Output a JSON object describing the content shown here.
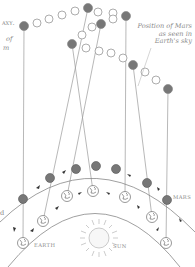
{
  "diagram": {
    "labels": {
      "position_caption": [
        "Position of Mars",
        "as seen in",
        "Earth's sky"
      ],
      "earth": "Earth",
      "mars": "Mars",
      "sun": "Sun",
      "cut_left_top": "axy.",
      "cut_left_mid1": "of",
      "cut_left_mid2": "m",
      "cut_left_low": "d"
    },
    "colors": {
      "line": "#9a9a9a",
      "mars_fill": "#777777",
      "open_circle_stroke": "#9a9a9a",
      "text": "#8a8a8a"
    },
    "sky_positions": [
      {
        "x": 24,
        "y": 26,
        "filled": true
      },
      {
        "x": 37,
        "y": 23,
        "filled": false
      },
      {
        "x": 49,
        "y": 19,
        "filled": false
      },
      {
        "x": 62,
        "y": 15,
        "filled": false
      },
      {
        "x": 75,
        "y": 11,
        "filled": false
      },
      {
        "x": 88,
        "y": 8,
        "filled": true
      },
      {
        "x": 98,
        "y": 12,
        "filled": false
      },
      {
        "x": 101,
        "y": 24,
        "filled": true
      },
      {
        "x": 92,
        "y": 27,
        "filled": false
      },
      {
        "x": 82,
        "y": 35,
        "filled": false
      },
      {
        "x": 72,
        "y": 44,
        "filled": true
      },
      {
        "x": 86,
        "y": 48,
        "filled": false
      },
      {
        "x": 99,
        "y": 51,
        "filled": false
      },
      {
        "x": 113,
        "y": 13,
        "filled": false
      },
      {
        "x": 113,
        "y": 19,
        "filled": false
      },
      {
        "x": 126,
        "y": 16,
        "filled": true
      },
      {
        "x": 111,
        "y": 53,
        "filled": false
      },
      {
        "x": 123,
        "y": 58,
        "filled": false
      },
      {
        "x": 133,
        "y": 65,
        "filled": true
      },
      {
        "x": 145,
        "y": 72,
        "filled": false
      },
      {
        "x": 156,
        "y": 80,
        "filled": false
      },
      {
        "x": 168,
        "y": 89,
        "filled": true
      }
    ],
    "mars_orbit_points": [
      {
        "x": 23,
        "y": 199
      },
      {
        "x": 50,
        "y": 178
      },
      {
        "x": 76,
        "y": 169
      },
      {
        "x": 96,
        "y": 166
      },
      {
        "x": 116,
        "y": 169
      },
      {
        "x": 147,
        "y": 183
      },
      {
        "x": 167,
        "y": 200
      }
    ],
    "earth_orbit_points": [
      {
        "x": 23,
        "y": 243
      },
      {
        "x": 43,
        "y": 221
      },
      {
        "x": 67,
        "y": 196
      },
      {
        "x": 93,
        "y": 191
      },
      {
        "x": 125,
        "y": 197
      },
      {
        "x": 152,
        "y": 217
      },
      {
        "x": 166,
        "y": 243
      }
    ],
    "sun": {
      "x": 99,
      "y": 238,
      "r": 13
    }
  }
}
